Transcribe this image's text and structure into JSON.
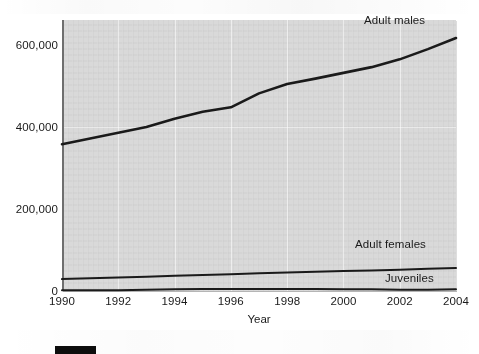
{
  "chart_data": {
    "type": "line",
    "title": "",
    "xlabel": "Year",
    "ylabel": "",
    "xlim": [
      1990,
      2004
    ],
    "ylim": [
      0,
      660000
    ],
    "grid": true,
    "legend_position": "inline-annotations",
    "x": [
      1990,
      1991,
      1992,
      1993,
      1994,
      1995,
      1996,
      1997,
      1998,
      1999,
      2000,
      2001,
      2002,
      2003,
      2004
    ],
    "xticks": [
      "1990",
      "1992",
      "1994",
      "1996",
      "1998",
      "2000",
      "2002",
      "2004"
    ],
    "yticks": [
      "0",
      "200,000",
      "400,000",
      "600,000"
    ],
    "ytick_values": [
      0,
      200000,
      400000,
      600000
    ],
    "series": [
      {
        "name": "Adult males",
        "color": "#1a1a1a",
        "values": [
          358000,
          372000,
          386000,
          400000,
          420000,
          437000,
          448000,
          482000,
          505000,
          518000,
          532000,
          546000,
          565000,
          590000,
          617000
        ]
      },
      {
        "name": "Adult females",
        "color": "#1a1a1a",
        "values": [
          29000,
          31000,
          33000,
          35000,
          37000,
          39000,
          41000,
          43000,
          45000,
          47000,
          49000,
          50000,
          52000,
          54000,
          56000
        ]
      },
      {
        "name": "Juveniles",
        "color": "#1a1a1a",
        "values": [
          2000,
          2000,
          2000,
          3000,
          4000,
          5000,
          5000,
          5000,
          5000,
          5000,
          4000,
          4000,
          3000,
          3000,
          4000
        ]
      }
    ]
  },
  "axes": {
    "x_title": "Year",
    "x_ticks": [
      "1990",
      "1992",
      "1994",
      "1996",
      "1998",
      "2000",
      "2002",
      "2004"
    ],
    "y_ticks": [
      "600,000",
      "400,000",
      "200,000",
      "0"
    ]
  },
  "annotations": {
    "adult_males": "Adult males",
    "adult_females": "Adult females",
    "juveniles": "Juveniles"
  },
  "colors": {
    "plot_background": "#d9d9d9",
    "line": "#1a1a1a",
    "page_background": "#ffffff",
    "legend_swatch": "#0d0d0d"
  }
}
